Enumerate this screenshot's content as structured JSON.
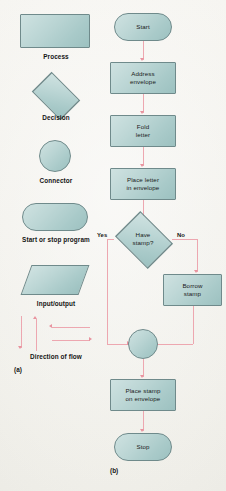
{
  "figure": {
    "part_a_label": "(a)",
    "part_b_label": "(b)",
    "symbol_fill_color": "#b3d0cf",
    "symbol_border_color": "#6f8a8b",
    "flow_line_color": "#eda7b0",
    "page_background": "#f3f2ee"
  },
  "legend": {
    "title_part": "(a)",
    "items": [
      {
        "shape": "rectangle",
        "label": "Process"
      },
      {
        "shape": "diamond",
        "label": "Decision"
      },
      {
        "shape": "circle",
        "label": "Connector"
      },
      {
        "shape": "stadium",
        "label": "Start or stop program"
      },
      {
        "shape": "parallelogram",
        "label": "Input/output"
      },
      {
        "shape": "arrows",
        "label": "Direction of flow"
      }
    ],
    "flow_arrows": [
      {
        "direction": "down"
      },
      {
        "direction": "up"
      },
      {
        "direction": "left"
      },
      {
        "direction": "right"
      }
    ]
  },
  "flowchart": {
    "title_part": "(b)",
    "nodes": [
      {
        "id": "start",
        "type": "terminator",
        "text": "Start"
      },
      {
        "id": "address",
        "type": "process",
        "text": "Address\nenvelope",
        "line1": "Address",
        "line2": "envelope"
      },
      {
        "id": "fold",
        "type": "process",
        "text": "Fold\nletter",
        "line1": "Fold",
        "line2": "letter"
      },
      {
        "id": "place_letter",
        "type": "process",
        "text": "Place letter\nin envelope",
        "line1": "Place letter",
        "line2": "in envelope"
      },
      {
        "id": "have_stamp",
        "type": "decision",
        "text": "Have\nstamp?",
        "line1": "Have",
        "line2": "stamp?"
      },
      {
        "id": "borrow",
        "type": "process",
        "text": "Borrow\nstamp",
        "line1": "Borrow",
        "line2": "stamp"
      },
      {
        "id": "connector",
        "type": "connector",
        "text": ""
      },
      {
        "id": "place_stamp",
        "type": "process",
        "text": "Place stamp\non envelope",
        "line1": "Place stamp",
        "line2": "on envelope"
      },
      {
        "id": "stop",
        "type": "terminator",
        "text": "Stop"
      }
    ],
    "branch_labels": {
      "yes": "Yes",
      "no": "No"
    },
    "edges": [
      {
        "from": "start",
        "to": "address"
      },
      {
        "from": "address",
        "to": "fold"
      },
      {
        "from": "fold",
        "to": "place_letter"
      },
      {
        "from": "place_letter",
        "to": "have_stamp"
      },
      {
        "from": "have_stamp",
        "to": "connector",
        "label": "Yes"
      },
      {
        "from": "have_stamp",
        "to": "borrow",
        "label": "No"
      },
      {
        "from": "borrow",
        "to": "connector"
      },
      {
        "from": "connector",
        "to": "place_stamp"
      },
      {
        "from": "place_stamp",
        "to": "stop"
      }
    ]
  }
}
